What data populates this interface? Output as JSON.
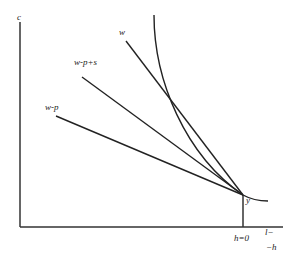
{
  "diagram": {
    "type": "budget-constraint / indifference-curve diagram",
    "axes": {
      "y_label": "c",
      "x_label_top": "l−",
      "x_label_bottom": "−h",
      "x_tick_label": "h=0"
    },
    "lines": [
      {
        "label": "w"
      },
      {
        "label": "w-p+s"
      },
      {
        "label": "w-p"
      }
    ],
    "point_label": "y",
    "colors": {
      "ink": "#222222",
      "background": "#ffffff"
    }
  }
}
